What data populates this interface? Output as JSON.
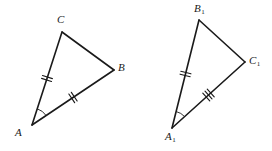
{
  "figure": {
    "type": "geometry-diagram",
    "background_color": "#ffffff",
    "stroke_color": "#1a1a1a",
    "triangles": [
      {
        "id": "triangle-abc",
        "name": "left-triangle",
        "vertices": [
          {
            "label": "A",
            "subscript": "",
            "x": 32,
            "y": 125,
            "label_x": 15,
            "label_y": 127
          },
          {
            "label": "C",
            "subscript": "",
            "x": 62,
            "y": 32,
            "label_x": 57,
            "label_y": 14
          },
          {
            "label": "B",
            "subscript": "",
            "x": 114,
            "y": 70,
            "label_x": 118,
            "label_y": 62
          }
        ],
        "sides": [
          {
            "name": "side-ac",
            "from": "A",
            "to": "C",
            "ticks": 2
          },
          {
            "name": "side-cb",
            "from": "C",
            "to": "B",
            "ticks": 0
          },
          {
            "name": "side-ab",
            "from": "A",
            "to": "B",
            "ticks": 2
          }
        ],
        "angle_marks": [
          {
            "name": "angle-a",
            "vertex": "A",
            "arcs": 1
          }
        ]
      },
      {
        "id": "triangle-a1b1c1",
        "name": "right-triangle",
        "vertices": [
          {
            "label": "A",
            "subscript": "1",
            "x": 172,
            "y": 128,
            "label_x": 165,
            "label_y": 131
          },
          {
            "label": "B",
            "subscript": "1",
            "x": 199,
            "y": 20,
            "label_x": 194,
            "label_y": 3
          },
          {
            "label": "C",
            "subscript": "1",
            "x": 245,
            "y": 62,
            "label_x": 249,
            "label_y": 55
          }
        ],
        "sides": [
          {
            "name": "side-a1b1",
            "from": "A1",
            "to": "B1",
            "ticks": 2
          },
          {
            "name": "side-b1c1",
            "from": "B1",
            "to": "C1",
            "ticks": 0
          },
          {
            "name": "side-a1c1",
            "from": "A1",
            "to": "C1",
            "ticks": 3
          }
        ],
        "angle_marks": [
          {
            "name": "angle-a1",
            "vertex": "A1",
            "arcs": 1
          }
        ]
      }
    ]
  }
}
